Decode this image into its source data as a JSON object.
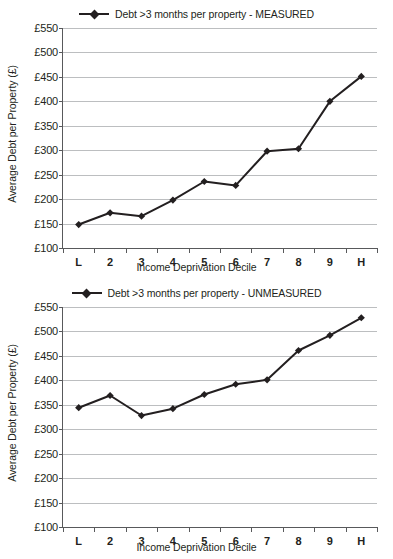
{
  "charts": [
    {
      "id": "measured",
      "legend_label": "Debt >3 months per property - MEASURED",
      "ylabel": "Average Debt per Property (£)",
      "xlabel": "Income Deprivation Decile",
      "series_name": "Debt >3 months per property - MEASURED"
    },
    {
      "id": "unmeasured",
      "legend_label": "Debt >3 months per property - UNMEASURED",
      "ylabel": "Average Debt per Property (£)",
      "xlabel": "Income Deprivation Decile",
      "series_name": "Debt >3 months per property - UNMEASURED"
    }
  ],
  "chart_data": [
    {
      "type": "line",
      "title": "",
      "legend": [
        "Debt >3 months per property - MEASURED"
      ],
      "legend_position": "top-center",
      "xlabel": "Income Deprivation Decile",
      "ylabel": "Average Debt per Property (£)",
      "categories": [
        "L",
        "2",
        "3",
        "4",
        "5",
        "6",
        "7",
        "8",
        "9",
        "H"
      ],
      "values": [
        148,
        172,
        165,
        198,
        236,
        228,
        298,
        303,
        400,
        451
      ],
      "ylim": [
        100,
        550
      ],
      "ytick_values": [
        100,
        150,
        200,
        250,
        300,
        350,
        400,
        450,
        500,
        550
      ],
      "ytick_labels": [
        "£100",
        "£150",
        "£200",
        "£250",
        "£300",
        "£350",
        "£400",
        "£450",
        "£500",
        "£550"
      ],
      "grid": true,
      "marker": "diamond",
      "line_color": "#231f20"
    },
    {
      "type": "line",
      "title": "",
      "legend": [
        "Debt >3 months per property - UNMEASURED"
      ],
      "legend_position": "top-center",
      "xlabel": "Income Deprivation Decile",
      "ylabel": "Average Debt per Property (£)",
      "categories": [
        "L",
        "2",
        "3",
        "4",
        "5",
        "6",
        "7",
        "8",
        "9",
        "H"
      ],
      "values": [
        344,
        369,
        328,
        342,
        371,
        392,
        401,
        461,
        492,
        528
      ],
      "ylim": [
        100,
        550
      ],
      "ytick_values": [
        100,
        150,
        200,
        250,
        300,
        350,
        400,
        450,
        500,
        550
      ],
      "ytick_labels": [
        "£100",
        "£150",
        "£200",
        "£250",
        "£300",
        "£350",
        "£400",
        "£450",
        "£500",
        "£550"
      ],
      "grid": true,
      "marker": "diamond",
      "line_color": "#231f20"
    }
  ]
}
